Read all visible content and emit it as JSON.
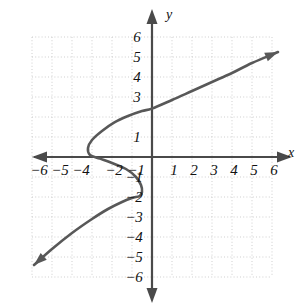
{
  "figure": {
    "kind": "cartesian-coordinate-plane-graph",
    "background_color": "#ffffff",
    "axis_color": "#4a4a4a",
    "grid_color": "#c9c9c9",
    "curve_color": "#585858",
    "label_color": "#111111",
    "x_axis_name": "x",
    "y_axis_name": "y"
  },
  "chart_data": {
    "type": "line",
    "title": "",
    "xlabel": "x",
    "ylabel": "y",
    "xlim": [
      -6,
      6
    ],
    "ylim": [
      -6,
      6
    ],
    "grid": true,
    "legend": "none",
    "x_ticks": [
      -6,
      -5,
      -4,
      -3,
      -2,
      -1,
      1,
      2,
      3,
      4,
      5,
      6
    ],
    "x_tick_labels": [
      "−6",
      "−5",
      "−4",
      "−3",
      "−2",
      "−1",
      "1",
      "2",
      "3",
      "4",
      "5",
      "6"
    ],
    "x_tick_labels_shown": [
      "−6",
      "−5",
      "−4",
      "−2",
      "−1",
      "1",
      "2",
      "3",
      "4",
      "5",
      "6"
    ],
    "y_ticks": [
      6,
      5,
      4,
      3,
      2,
      1,
      -1,
      -2,
      -3,
      -4,
      -5,
      -6
    ],
    "y_tick_labels": [
      "6",
      "5",
      "4",
      "3",
      "2",
      "1",
      "−1",
      "−2",
      "−3",
      "−4",
      "−5",
      "−6"
    ],
    "y_tick_labels_shown": [
      "6",
      "5",
      "4",
      "3",
      "1",
      "−1",
      "−2",
      "−3",
      "−4",
      "−5",
      "−6"
    ],
    "units_per_grid": 1,
    "pixels_per_unit": 20,
    "origin_px": [
      152,
      157
    ],
    "series": [
      {
        "name": "curve",
        "style": "solid",
        "arrow_start": true,
        "arrow_end": true,
        "description": "S-shaped sideways cubic relation, fails the vertical line test",
        "points": [
          [
            -5.9,
            -5.4
          ],
          [
            -5.0,
            -4.6
          ],
          [
            -4.0,
            -3.8
          ],
          [
            -3.0,
            -3.1
          ],
          [
            -2.2,
            -2.6
          ],
          [
            -1.5,
            -2.25
          ],
          [
            -1.0,
            -2.05
          ],
          [
            -0.62,
            -1.95
          ],
          [
            -0.5,
            -1.75
          ],
          [
            -0.55,
            -1.4
          ],
          [
            -0.8,
            -1.0
          ],
          [
            -1.3,
            -0.6
          ],
          [
            -2.0,
            -0.3
          ],
          [
            -2.6,
            -0.08
          ],
          [
            -3.1,
            0.1
          ],
          [
            -3.2,
            0.45
          ],
          [
            -3.0,
            0.85
          ],
          [
            -2.5,
            1.3
          ],
          [
            -1.9,
            1.72
          ],
          [
            -1.2,
            2.05
          ],
          [
            -0.5,
            2.3
          ],
          [
            0.0,
            2.42
          ],
          [
            1.0,
            2.85
          ],
          [
            2.0,
            3.3
          ],
          [
            3.0,
            3.75
          ],
          [
            4.0,
            4.2
          ],
          [
            5.0,
            4.7
          ],
          [
            6.3,
            5.25
          ]
        ]
      }
    ],
    "annotations": [
      {
        "text": "y",
        "position": "top of vertical axis",
        "italic": true
      },
      {
        "text": "x",
        "position": "right end of horizontal axis",
        "italic": true
      }
    ]
  },
  "x_tick_items": [
    {
      "label": "−6",
      "value": -6,
      "x_px": 39,
      "y_px": 163
    },
    {
      "label": "−5",
      "value": -5,
      "x_px": 60,
      "y_px": 163
    },
    {
      "label": "−4",
      "value": -4,
      "x_px": 81,
      "y_px": 163
    },
    {
      "label": "−2",
      "value": -2,
      "x_px": 114,
      "y_px": 163
    },
    {
      "label": "−1",
      "value": -1,
      "x_px": 136,
      "y_px": 163
    },
    {
      "label": "1",
      "value": 1,
      "x_px": 174,
      "y_px": 163
    },
    {
      "label": "2",
      "value": 2,
      "x_px": 194,
      "y_px": 163
    },
    {
      "label": "3",
      "value": 3,
      "x_px": 214,
      "y_px": 163
    },
    {
      "label": "4",
      "value": 4,
      "x_px": 234,
      "y_px": 163
    },
    {
      "label": "5",
      "value": 5,
      "x_px": 254,
      "y_px": 163
    },
    {
      "label": "6",
      "value": 6,
      "x_px": 274,
      "y_px": 163
    }
  ],
  "y_tick_items": [
    {
      "label": "6",
      "value": 6,
      "x_px": 137,
      "y_px": 30
    },
    {
      "label": "5",
      "value": 5,
      "x_px": 137,
      "y_px": 50
    },
    {
      "label": "4",
      "value": 4,
      "x_px": 137,
      "y_px": 70
    },
    {
      "label": "3",
      "value": 3,
      "x_px": 137,
      "y_px": 90
    },
    {
      "label": "1",
      "value": 1,
      "x_px": 137,
      "y_px": 130
    },
    {
      "label": "−1",
      "value": -1,
      "x_px": 134,
      "y_px": 170
    },
    {
      "label": "−2",
      "value": -2,
      "x_px": 134,
      "y_px": 190
    },
    {
      "label": "−3",
      "value": -3,
      "x_px": 134,
      "y_px": 210
    },
    {
      "label": "−4",
      "value": -4,
      "x_px": 134,
      "y_px": 230
    },
    {
      "label": "−5",
      "value": -5,
      "x_px": 134,
      "y_px": 250
    },
    {
      "label": "−6",
      "value": -6,
      "x_px": 134,
      "y_px": 270
    }
  ]
}
